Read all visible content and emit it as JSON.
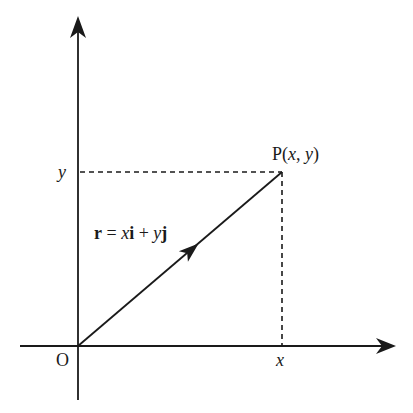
{
  "diagram": {
    "type": "position-vector",
    "colors": {
      "line": "#1a1a1a",
      "background": "#ffffff"
    },
    "axes": {
      "origin_label": "O",
      "x_tick_label": "x",
      "y_tick_label": "y"
    },
    "point": {
      "name": "P",
      "open": "(",
      "x": "x",
      "sep": ", ",
      "y": "y",
      "close": ")"
    },
    "vector": {
      "r": "r",
      "eq": " = ",
      "x": "x",
      "i": "i",
      "plus": " + ",
      "y": "y",
      "j": "j"
    }
  }
}
